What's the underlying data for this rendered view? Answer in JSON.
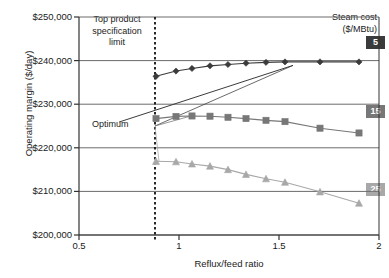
{
  "chart_data": {
    "type": "line",
    "title": "",
    "xlabel": "Reflux/feed ratio",
    "ylabel": "Operating margin ($/day)",
    "xlim": [
      0.5,
      2.0
    ],
    "ylim": [
      200000,
      250000
    ],
    "xticks": [
      "0.5",
      "1",
      "1.5",
      "2"
    ],
    "xtick_values": [
      0.5,
      1,
      1.5,
      2
    ],
    "yticks": [
      "$200,000",
      "$210,000",
      "$220,000",
      "$230,000",
      "$240,000",
      "$250,000"
    ],
    "ytick_values": [
      200000,
      210000,
      220000,
      230000,
      240000,
      250000
    ],
    "grid": "horizontal",
    "legend_position": "right-inside",
    "legend_title_line1": "Steam cost",
    "legend_title_line2": "($/MBtu)",
    "annotations": [
      {
        "name": "spec-limit",
        "text_lines": [
          "Top product",
          "specification",
          "limit"
        ],
        "x_value": 0.88,
        "style": "vertical-dashed-line"
      },
      {
        "name": "optimum",
        "text": "Optimum",
        "style": "leader-lines"
      }
    ],
    "series": [
      {
        "name": "5",
        "label": "5",
        "color": "#3b3b3b",
        "marker": "diamond",
        "x": [
          0.885,
          0.985,
          1.065,
          1.155,
          1.245,
          1.335,
          1.435,
          1.53,
          1.705,
          1.9
        ],
        "y": [
          236400,
          237600,
          238200,
          238800,
          239100,
          239400,
          239600,
          239700,
          239700,
          239700
        ],
        "optimum_x": 1.57,
        "optimum_y": 238900
      },
      {
        "name": "15",
        "label": "15",
        "color": "#777777",
        "marker": "square",
        "x": [
          0.885,
          0.985,
          1.065,
          1.155,
          1.245,
          1.335,
          1.435,
          1.53,
          1.705,
          1.9
        ],
        "y": [
          226700,
          227200,
          227300,
          227250,
          227000,
          226700,
          226300,
          226000,
          224500,
          223400
        ],
        "optimum_x": 1.06,
        "optimum_y": 227300
      },
      {
        "name": "25",
        "label": "25",
        "color": "#a8a8a8",
        "marker": "triangle",
        "x": [
          0.885,
          0.985,
          1.065,
          1.155,
          1.245,
          1.335,
          1.435,
          1.53,
          1.705,
          1.9
        ],
        "y": [
          216900,
          216800,
          216300,
          215800,
          215000,
          213900,
          212900,
          212100,
          209900,
          207300
        ],
        "optimum_x": 0.9,
        "optimum_y": 216900
      }
    ],
    "optimum_trend_line": {
      "from_x": 0.7,
      "from_y": 225900,
      "to_x": 1.57,
      "to_y": 238900,
      "color": "#3b3b3b"
    },
    "colors": {
      "axis": "#333333",
      "grid": "#6b6b6b",
      "background": "#ffffff",
      "series_5": "#3b3b3b",
      "series_15": "#777777",
      "series_25": "#a8a8a8"
    }
  },
  "labels": {
    "ylabel": "Operating margin ($/day)",
    "xlabel": "Reflux/feed ratio",
    "spec_line1": "Top product",
    "spec_line2": "specification",
    "spec_line3": "limit",
    "optimum": "Optimum",
    "legend_l1": "Steam cost",
    "legend_l2": "($/MBtu)",
    "lg5": "5",
    "lg15": "15",
    "lg25": "25",
    "y0": "$200,000",
    "y1": "$210,000",
    "y2": "$220,000",
    "y3": "$230,000",
    "y4": "$240,000",
    "y5": "$250,000",
    "x0": "0.5",
    "x1": "1",
    "x2": "1.5",
    "x3": "2"
  }
}
